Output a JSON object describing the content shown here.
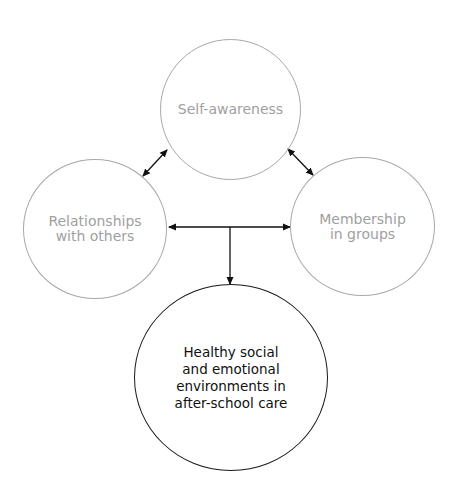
{
  "diagram": {
    "nodes": [
      {
        "id": "self-awareness",
        "label": "Self-awareness"
      },
      {
        "id": "relationships",
        "label": "Relationships\nwith others"
      },
      {
        "id": "membership",
        "label": "Membership\nin groups"
      },
      {
        "id": "outcome",
        "label": "Healthy social\nand emotional\nenvironments in\nafter-school care"
      }
    ],
    "edges": [
      {
        "from": "self-awareness",
        "to": "relationships",
        "type": "bidirectional"
      },
      {
        "from": "self-awareness",
        "to": "membership",
        "type": "bidirectional"
      },
      {
        "from": "relationships",
        "to": "membership",
        "type": "bidirectional"
      },
      {
        "from": "relationships-membership-link",
        "to": "outcome",
        "type": "directed"
      }
    ],
    "colors": {
      "secondary_node": "#a8a8a8",
      "primary_node": "#1a1a1a",
      "arrow": "#111111"
    }
  }
}
